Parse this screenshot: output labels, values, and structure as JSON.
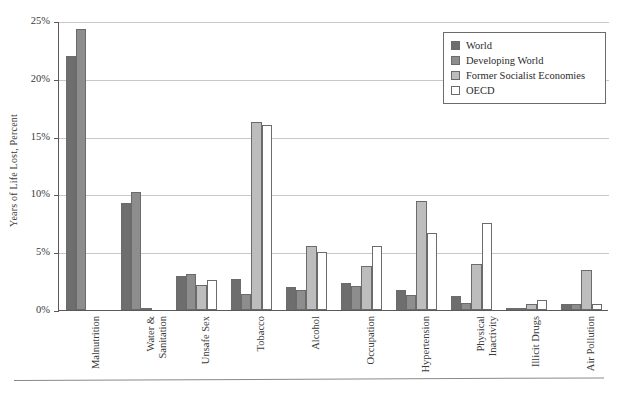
{
  "chart_data": {
    "type": "bar",
    "title": "",
    "xlabel": "",
    "ylabel": "Years of Life Lost, Percent",
    "ylim": [
      0,
      25
    ],
    "yunit": "%",
    "ytick_labels": [
      "0%",
      "5%",
      "10%",
      "15%",
      "20%",
      "25%"
    ],
    "ytick_values": [
      0,
      5,
      10,
      15,
      20,
      25
    ],
    "grid": true,
    "legend_position": "top-right",
    "categories": [
      "Malnutrition",
      "Water & Sanitation",
      "Unsafe Sex",
      "Tobacco",
      "Alcohol",
      "Occupation",
      "Hypertension",
      "Physical Inactivity",
      "Illicit Drugs",
      "Air Pollution"
    ],
    "category_lines": [
      [
        "Malnutrition"
      ],
      [
        "Water &",
        "Sanitation"
      ],
      [
        "Unsafe Sex"
      ],
      [
        "Tobacco"
      ],
      [
        "Alcohol"
      ],
      [
        "Occupation"
      ],
      [
        "Hypertension"
      ],
      [
        "Physical",
        "Inactivity"
      ],
      [
        "Illicit Drugs"
      ],
      [
        "Air Pollution"
      ]
    ],
    "series": [
      {
        "name": "World",
        "color": "#6e6e6e",
        "values": [
          22.0,
          9.3,
          2.9,
          2.7,
          2.0,
          2.3,
          1.7,
          1.2,
          0.2,
          0.5
        ]
      },
      {
        "name": "Developing World",
        "color": "#8d8d8d",
        "values": [
          24.3,
          10.2,
          3.1,
          1.4,
          1.7,
          2.1,
          1.3,
          0.6,
          0.2,
          0.5
        ]
      },
      {
        "name": "Former Socialist Economies",
        "color": "#bdbdbd",
        "values": [
          0.0,
          0.2,
          2.2,
          16.3,
          5.5,
          3.8,
          9.4,
          4.0,
          0.5,
          3.5
        ]
      },
      {
        "name": "OECD",
        "color": "#ffffff",
        "values": [
          0.0,
          0.0,
          2.6,
          16.0,
          5.0,
          5.5,
          6.7,
          7.5,
          0.9,
          0.5
        ]
      }
    ]
  },
  "legend": {
    "items": [
      {
        "label": "World",
        "color": "#6e6e6e"
      },
      {
        "label": "Developing World",
        "color": "#8d8d8d"
      },
      {
        "label": "Former Socialist Economies",
        "color": "#bdbdbd"
      },
      {
        "label": "OECD",
        "color": "#ffffff"
      }
    ]
  }
}
